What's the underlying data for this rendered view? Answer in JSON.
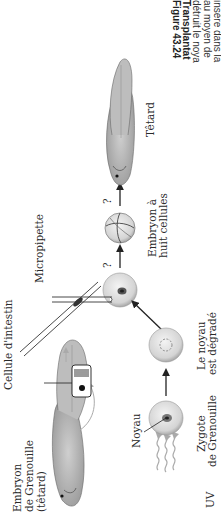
{
  "figure": {
    "caption_lines": [
      {
        "text": "Figure 43.24",
        "bold": true
      },
      {
        "text": "Transplantat",
        "bold": true
      },
      {
        "text": "détruit le noya",
        "bold": false
      },
      {
        "text": "au moyen de",
        "bold": false
      },
      {
        "text": "insère dans la",
        "bold": false
      },
      {
        "text": "stade de dév",
        "bold": false
      },
      {
        "text": "de vérifier si l",
        "bold": false
      },
      {
        "text": "changements",
        "bold": false
      },
      {
        "text": "différenciation",
        "bold": false
      },
      {
        "text": "développeme",
        "bold": false
      },
      {
        "text": "précoce, plus",
        "bold": false
      },
      {
        "text": "le développe",
        "bold": false
      },
      {
        "text": "prélevés à de",
        "bold": false
      },
      {
        "text": "s'avèrent fréq",
        "bold": false
      },
      {
        "text": "les noyaux p",
        "bold": false
      },
      {
        "text": "(comme celui",
        "bold": false
      }
    ],
    "labels": {
      "donor_embryo": [
        "Embryon",
        "de Grenouille",
        "(têtard)"
      ],
      "intestine_cell": "Cellule d'intestin",
      "micropipette": "Micropipette",
      "nucleus": "Noyau",
      "uv": "UV",
      "zygote": [
        "Zygote",
        "de Grenouille"
      ],
      "degraded_nucleus": [
        "Le noyau",
        "est dégradé"
      ],
      "eight_cell_embryo": [
        "Embryon à",
        "huit cellules"
      ],
      "tadpole": "Têtard",
      "question_mark_1": "?",
      "question_mark_2": "?"
    }
  }
}
